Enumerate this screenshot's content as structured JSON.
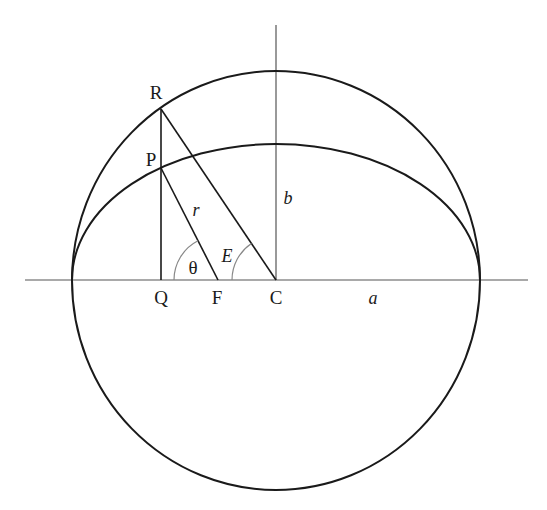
{
  "diagram": {
    "labels": {
      "R": "R",
      "P": "P",
      "Q": "Q",
      "F": "F",
      "C": "C",
      "r": "r",
      "b": "b",
      "a": "a",
      "theta": "θ",
      "E": "E"
    },
    "colors": {
      "stroke": "#1a1a1a",
      "axis": "#555555",
      "arc": "#888888"
    },
    "geometry": {
      "center": [
        276,
        280
      ],
      "circle_radius": [
        204,
        209
      ],
      "ellipse_semi_axes": [
        204,
        136
      ],
      "points": {
        "R": [
          161,
          108
        ],
        "P": [
          161,
          168
        ],
        "Q": [
          161,
          280
        ],
        "F": [
          218,
          280
        ],
        "C": [
          276,
          280
        ]
      }
    }
  }
}
